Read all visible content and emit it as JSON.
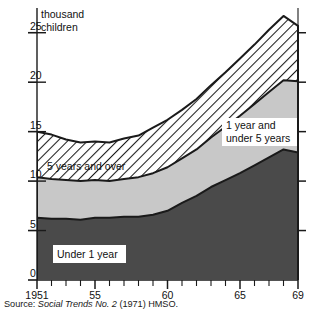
{
  "figure": {
    "y_axis_title_line1": "thousand",
    "y_axis_title_line2": "children",
    "source": "Source: ",
    "source_italic": "Social Trends No. 2",
    "source_tail": " (1971) HMSO."
  },
  "legend": {
    "band_top_label": "5 years and over",
    "band_mid_label_line1": "1 year and",
    "band_mid_label_line2": "under 5 years",
    "band_bottom_label": "Under 1 year"
  },
  "colors": {
    "under_1_year": "#4a4a4a",
    "one_to_five": "#c8c8c8",
    "five_and_over": "#ffffff",
    "hatch_stroke": "#1a1a1a",
    "axis": "#1a1a1a",
    "background": "#ffffff"
  },
  "chart_data": {
    "type": "area",
    "stacked": true,
    "title": "",
    "subtitle": "",
    "xlabel": "",
    "ylabel": "thousand children",
    "ylim": [
      0,
      27.5
    ],
    "xlim": [
      1951,
      1969
    ],
    "grid": false,
    "legend_position": "inside",
    "y_ticks": [
      0,
      5,
      10,
      15,
      20,
      25
    ],
    "y_tick_labels": [
      "0",
      "5",
      "10",
      "15",
      "20",
      "25"
    ],
    "x_ticks": [
      1951,
      1952,
      1953,
      1954,
      1955,
      1956,
      1957,
      1958,
      1959,
      1960,
      1961,
      1962,
      1963,
      1964,
      1965,
      1966,
      1967,
      1968,
      1969
    ],
    "x_tick_labels": [
      "1951",
      "",
      "",
      "",
      "55",
      "",
      "",
      "",
      "",
      "60",
      "",
      "",
      "",
      "",
      "65",
      "",
      "",
      "",
      "69"
    ],
    "x": [
      1951,
      1952,
      1953,
      1954,
      1955,
      1956,
      1957,
      1958,
      1959,
      1960,
      1961,
      1962,
      1963,
      1964,
      1965,
      1966,
      1967,
      1968,
      1969
    ],
    "series": [
      {
        "name": "Under 1 year",
        "values": [
          6.3,
          6.2,
          6.2,
          6.1,
          6.3,
          6.3,
          6.4,
          6.4,
          6.6,
          7.0,
          7.8,
          8.5,
          9.4,
          10.1,
          10.8,
          11.6,
          12.4,
          13.2,
          12.9
        ]
      },
      {
        "name": "1 year and under 5 years",
        "values": [
          4.1,
          4.0,
          3.9,
          3.9,
          3.8,
          3.7,
          3.8,
          4.0,
          4.2,
          4.4,
          4.5,
          4.7,
          5.0,
          5.4,
          5.8,
          6.2,
          6.6,
          7.0,
          7.2
        ]
      },
      {
        "name": "5 years and over",
        "values": [
          4.6,
          4.5,
          4.1,
          3.9,
          3.9,
          3.9,
          4.1,
          4.2,
          4.6,
          4.8,
          4.9,
          5.1,
          5.3,
          5.5,
          5.8,
          6.0,
          6.3,
          6.5,
          5.6
        ]
      }
    ],
    "totals": [
      15.0,
      14.7,
      14.2,
      13.9,
      14.0,
      13.9,
      14.3,
      14.6,
      15.4,
      16.2,
      17.2,
      18.3,
      19.7,
      21.0,
      22.4,
      23.8,
      25.3,
      26.7,
      25.7
    ]
  }
}
